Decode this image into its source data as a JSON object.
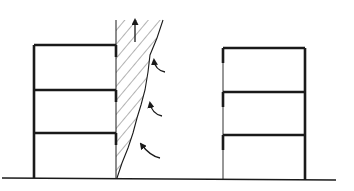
{
  "diagram": {
    "colors": {
      "background": "#ffffff",
      "ink": "#1a1a1a",
      "hatch": "#555555"
    },
    "ground": {
      "x1": 2,
      "y1": 178,
      "x2": 336,
      "y2": 180
    },
    "left_building": {
      "x_left": 34,
      "x_right": 116,
      "levels_y": [
        45,
        90,
        133,
        178
      ]
    },
    "right_building": {
      "x_left": 223,
      "x_right": 305,
      "levels_y": [
        48,
        92,
        135,
        180
      ]
    },
    "wedge": {
      "top_y": 20,
      "left_x": 116,
      "right_edge_points": [
        [
          163,
          20
        ],
        [
          157,
          38
        ],
        [
          150,
          55
        ],
        [
          148,
          72
        ],
        [
          145,
          90
        ],
        [
          141,
          105
        ],
        [
          137,
          118
        ],
        [
          133,
          133
        ],
        [
          128,
          148
        ],
        [
          122,
          163
        ],
        [
          117,
          178
        ]
      ]
    },
    "arrows": {
      "up": {
        "x": 135,
        "y_from": 42,
        "y_to": 16
      },
      "curved": [
        {
          "from": [
            165,
            72
          ],
          "to": [
            154,
            60
          ]
        },
        {
          "from": [
            162,
            116
          ],
          "to": [
            150,
            103
          ]
        },
        {
          "from": [
            160,
            158
          ],
          "to": [
            141,
            144
          ]
        }
      ]
    }
  }
}
